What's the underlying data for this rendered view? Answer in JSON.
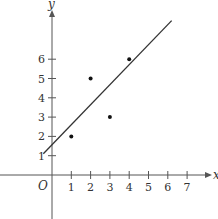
{
  "chart_data": {
    "type": "scatter",
    "title": "",
    "xlabel": "x",
    "ylabel": "y",
    "origin_label": "O",
    "x_ticks": [
      1,
      2,
      3,
      4,
      5,
      6,
      7
    ],
    "y_ticks": [
      1,
      2,
      3,
      4,
      5,
      6
    ],
    "xlim": [
      -2.7,
      8.3
    ],
    "ylim": [
      -2.3,
      9.0
    ],
    "grid": false,
    "legend": null,
    "points": [
      {
        "x": 1,
        "y": 2
      },
      {
        "x": 2,
        "y": 5
      },
      {
        "x": 3,
        "y": 3
      },
      {
        "x": 4,
        "y": 6
      }
    ],
    "fit_line": {
      "x_start": -0.45,
      "y_start": 1.1,
      "x_end": 6.2,
      "y_end": 8.0,
      "approx_equation": "y ≈ 1.05x + 1.5"
    }
  }
}
